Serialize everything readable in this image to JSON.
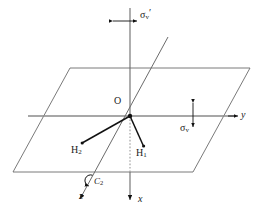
{
  "figure": {
    "background_color": "#ffffff",
    "line_color": "#555555",
    "bond_color": "#111111",
    "axis_color": "#777777",
    "label_color": "#1a1a1a",
    "width": 261,
    "height": 220
  },
  "labels": {
    "origin": "O",
    "hydrogen_1": "H",
    "hydrogen_1_sub": "1",
    "hydrogen_2": "H",
    "hydrogen_2_sub": "2",
    "axis_x": "x",
    "axis_y": "y",
    "axis_z": "z",
    "sigma_v": "σ",
    "sigma_v_sub": "v",
    "sigma_v_prime": "σ",
    "sigma_v_prime_sub": "v",
    "sigma_v_prime_mark": "′",
    "rotation_axis": "C",
    "rotation_axis_sub": "2"
  },
  "geometry": {
    "origin": {
      "x": 130,
      "y": 116
    },
    "plane_corners": [
      {
        "x": 70,
        "y": 68
      },
      {
        "x": 250,
        "y": 68
      },
      {
        "x": 193,
        "y": 172
      },
      {
        "x": 13,
        "y": 172
      }
    ],
    "y_axis": {
      "x1": 28,
      "y1": 116,
      "x2": 237,
      "y2": 116
    },
    "x_axis": {
      "x1": 130,
      "y1": 8,
      "x2": 130,
      "y2": 205
    },
    "z_axis": {
      "x1": 168,
      "y1": 37,
      "x2": 77,
      "y2": 205
    },
    "bond_h1": {
      "x1": 130,
      "y1": 116,
      "x2": 143,
      "y2": 146
    },
    "bond_h2": {
      "x1": 130,
      "y1": 116,
      "x2": 82,
      "y2": 143
    },
    "sigma_v_prime_arrow": {
      "x1": 112,
      "y1": 21,
      "x2": 138,
      "y2": 21
    },
    "sigma_v_arrow": {
      "x1": 193,
      "y1": 102,
      "x2": 193,
      "y2": 128
    },
    "c2_rotation_arrow": {
      "cx": 88,
      "cy": 180,
      "r": 6
    }
  },
  "label_positions": {
    "origin": {
      "x": 116,
      "y": 102
    },
    "hydrogen_1": {
      "x": 139,
      "y": 150
    },
    "hydrogen_2": {
      "x": 77,
      "y": 147
    },
    "axis_x": {
      "x": 139,
      "y": 198
    },
    "axis_y": {
      "x": 243,
      "y": 113
    },
    "axis_z": {
      "x": 80,
      "y": 195
    },
    "sigma_v": {
      "x": 182,
      "y": 126
    },
    "sigma_v_prime": {
      "x": 140,
      "y": 9
    },
    "rotation_axis": {
      "x": 95,
      "y": 180
    }
  }
}
